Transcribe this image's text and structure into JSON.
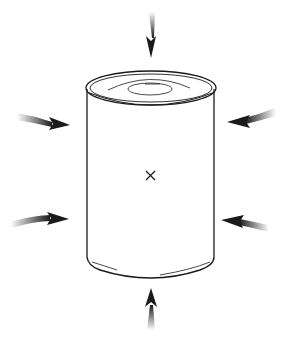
{
  "figure": {
    "center_marker": "×",
    "arrows": [
      {
        "id": "top",
        "direction": "down"
      },
      {
        "id": "left-upper",
        "direction": "right"
      },
      {
        "id": "right-upper",
        "direction": "left"
      },
      {
        "id": "left-lower",
        "direction": "right"
      },
      {
        "id": "right-lower",
        "direction": "left"
      },
      {
        "id": "bottom",
        "direction": "up"
      }
    ],
    "colors": {
      "line": "#1a1a1a",
      "background": "#ffffff"
    }
  }
}
